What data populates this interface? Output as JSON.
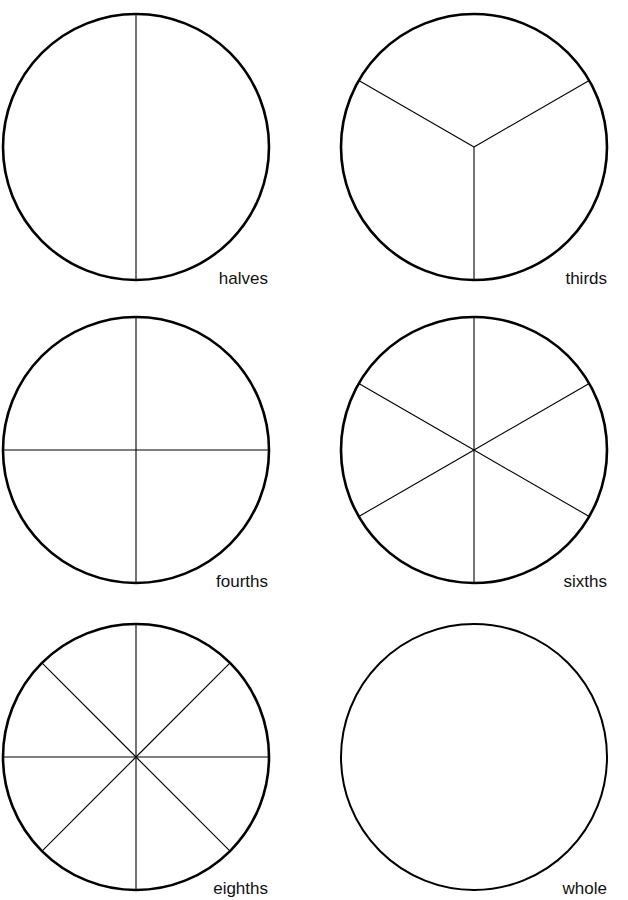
{
  "page": {
    "width": 628,
    "height": 900,
    "background": "#ffffff",
    "ink": "#000000",
    "clipped_header_text": " "
  },
  "worksheet": {
    "title": "Fraction Circles",
    "columns": 2,
    "rows": 3
  },
  "chart_data": {
    "type": "pie",
    "subtitle": "",
    "xlabel": "",
    "ylabel": "",
    "legend": "none",
    "grid": false,
    "note": "Six unit circles, each divided into equal sectors; every sector is an equal fraction of the whole.",
    "figures": [
      {
        "id": "halves",
        "label": "halves",
        "parts": 2,
        "fraction_each": "1/2",
        "values": [
          50,
          50
        ],
        "slice_degrees": [
          180,
          180
        ],
        "radii_angles_deg": [
          90,
          270
        ],
        "diameters_deg": [
          90
        ],
        "divided": true,
        "cx": 136,
        "cy": 147,
        "r": 133,
        "outline_width": 2.6,
        "divider_width": 1.1,
        "label_x": 268,
        "label_y": 270
      },
      {
        "id": "thirds",
        "label": "thirds",
        "parts": 3,
        "fraction_each": "1/3",
        "values": [
          33.3,
          33.3,
          33.3
        ],
        "slice_degrees": [
          120,
          120,
          120
        ],
        "radii_angles_deg": [
          270,
          30,
          150
        ],
        "diameters_deg": [],
        "divided": true,
        "cx": 474,
        "cy": 147,
        "r": 133,
        "outline_width": 2.6,
        "divider_width": 1.1,
        "label_x": 607,
        "label_y": 270
      },
      {
        "id": "fourths",
        "label": "fourths",
        "parts": 4,
        "fraction_each": "1/4",
        "values": [
          25,
          25,
          25,
          25
        ],
        "slice_degrees": [
          90,
          90,
          90,
          90
        ],
        "radii_angles_deg": [
          0,
          90,
          180,
          270
        ],
        "diameters_deg": [
          0,
          90
        ],
        "divided": true,
        "cx": 136,
        "cy": 450,
        "r": 133,
        "outline_width": 2.6,
        "divider_width": 1.1,
        "label_x": 268,
        "label_y": 573
      },
      {
        "id": "sixths",
        "label": "sixths",
        "parts": 6,
        "fraction_each": "1/6",
        "values": [
          16.7,
          16.7,
          16.7,
          16.7,
          16.7,
          16.7
        ],
        "slice_degrees": [
          60,
          60,
          60,
          60,
          60,
          60
        ],
        "radii_angles_deg": [
          30,
          90,
          150,
          210,
          270,
          330
        ],
        "diameters_deg": [
          30,
          90,
          150
        ],
        "divided": true,
        "cx": 474,
        "cy": 450,
        "r": 133,
        "outline_width": 2.6,
        "divider_width": 1.1,
        "label_x": 607,
        "label_y": 573
      },
      {
        "id": "eighths",
        "label": "eighths",
        "parts": 8,
        "fraction_each": "1/8",
        "values": [
          12.5,
          12.5,
          12.5,
          12.5,
          12.5,
          12.5,
          12.5,
          12.5
        ],
        "slice_degrees": [
          45,
          45,
          45,
          45,
          45,
          45,
          45,
          45
        ],
        "radii_angles_deg": [
          0,
          45,
          90,
          135,
          180,
          225,
          270,
          315
        ],
        "diameters_deg": [
          0,
          45,
          90,
          135
        ],
        "divided": true,
        "cx": 136,
        "cy": 757,
        "r": 133,
        "outline_width": 2.6,
        "divider_width": 1.1,
        "label_x": 268,
        "label_y": 880
      },
      {
        "id": "whole",
        "label": "whole",
        "parts": 1,
        "fraction_each": "1/1",
        "values": [
          100
        ],
        "slice_degrees": [
          360
        ],
        "radii_angles_deg": [],
        "diameters_deg": [],
        "divided": false,
        "cx": 474,
        "cy": 757,
        "r": 133,
        "outline_width": 2.0,
        "divider_width": 1.1,
        "label_x": 607,
        "label_y": 880
      }
    ]
  }
}
